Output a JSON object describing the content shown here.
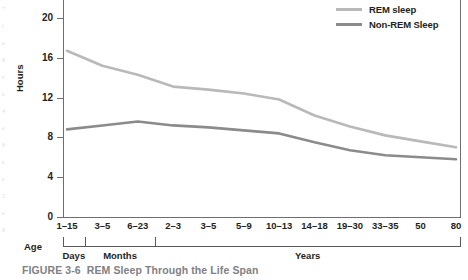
{
  "caption": {
    "number": "FIGURE 3-6",
    "title": "REM Sleep Through the Life Span"
  },
  "legend": {
    "items": [
      {
        "label": "REM sleep",
        "color": "#b9b9b9"
      },
      {
        "label": "Non-REM Sleep",
        "color": "#8b8b8b"
      }
    ]
  },
  "axis": {
    "y_title": "Hours",
    "y_ticks": [
      "0",
      "4",
      "8",
      "12",
      "16",
      "20"
    ],
    "x_group_title": "Age"
  },
  "bleed_marks": [
    "7",
    "r",
    "e",
    "9",
    "s",
    "s",
    "4",
    "e",
    "9",
    "s",
    "s",
    "5",
    "e",
    "9"
  ],
  "chart_data": {
    "type": "line",
    "title": "REM Sleep Through the Life Span",
    "xlabel": "Age",
    "ylabel": "Hours",
    "ylim": [
      0,
      21
    ],
    "yticks": [
      0,
      4,
      8,
      12,
      16,
      20
    ],
    "grid": false,
    "legend_position": "top-right",
    "categories": [
      "1–15",
      "3–5",
      "6–23",
      "2–3",
      "3–5",
      "5–9",
      "10–13",
      "14–18",
      "19–30",
      "33–35",
      "50",
      "80"
    ],
    "category_groups": [
      {
        "label": "Days",
        "categories": [
          "1–15"
        ]
      },
      {
        "label": "Months",
        "categories": [
          "3–5",
          "6–23"
        ]
      },
      {
        "label": "Years",
        "categories": [
          "2–3",
          "3–5",
          "5–9",
          "10–13",
          "14–18",
          "19–30",
          "33–35",
          "50",
          "80"
        ]
      }
    ],
    "series": [
      {
        "name": "REM sleep",
        "color": "#b9b9b9",
        "values": [
          16.7,
          15.2,
          14.3,
          13.1,
          12.8,
          12.4,
          11.8,
          10.2,
          9.1,
          8.2,
          7.6,
          7.0
        ]
      },
      {
        "name": "Non-REM Sleep",
        "color": "#8b8b8b",
        "values": [
          8.8,
          9.2,
          9.6,
          9.2,
          9.0,
          8.7,
          8.4,
          7.5,
          6.7,
          6.2,
          6.0,
          5.8
        ]
      }
    ]
  }
}
